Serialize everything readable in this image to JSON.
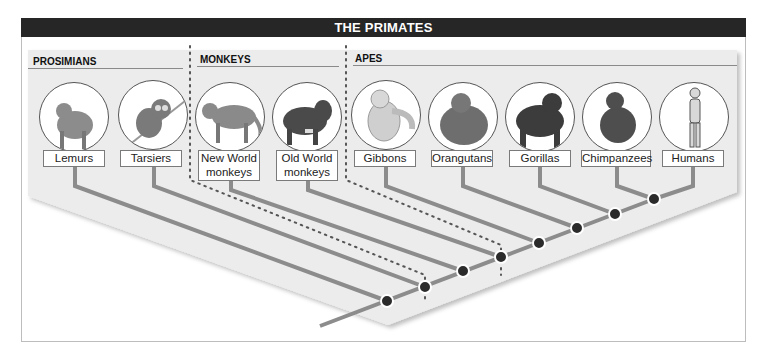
{
  "title": "THE PRIMATES",
  "sections": [
    {
      "label": "PROSIMIANS"
    },
    {
      "label": "MONKEYS"
    },
    {
      "label": "APES"
    }
  ],
  "taxa": [
    {
      "label": "Lemurs",
      "group": "PROSIMIANS",
      "icon": "lemur-icon",
      "fill": "#8c8c8c"
    },
    {
      "label": "Tarsiers",
      "group": "PROSIMIANS",
      "icon": "tarsier-icon",
      "fill": "#7a7a7a"
    },
    {
      "label": "New World monkeys",
      "line1": "New World",
      "line2": "monkeys",
      "group": "MONKEYS",
      "icon": "new-world-monkey-icon",
      "fill": "#8a8a8a"
    },
    {
      "label": "Old World monkeys",
      "line1": "Old World",
      "line2": "monkeys",
      "group": "MONKEYS",
      "icon": "old-world-monkey-icon",
      "fill": "#4a4a4a"
    },
    {
      "label": "Gibbons",
      "group": "APES",
      "icon": "gibbon-icon",
      "fill": "#cfcfcf"
    },
    {
      "label": "Orangutans",
      "group": "APES",
      "icon": "orangutan-icon",
      "fill": "#6e6e6e"
    },
    {
      "label": "Gorillas",
      "group": "APES",
      "icon": "gorilla-icon",
      "fill": "#3c3c3c"
    },
    {
      "label": "Chimpanzees",
      "group": "APES",
      "icon": "chimpanzee-icon",
      "fill": "#4e4e4e"
    },
    {
      "label": "Humans",
      "group": "APES",
      "icon": "human-icon",
      "fill": "#d8d8d8"
    }
  ],
  "colors": {
    "title_bar": "#262626",
    "panel": "#ececec",
    "branch": "#8c8c8c",
    "node": "#2b2b2b",
    "dotted_divider": "#555555"
  },
  "tree": {
    "node_count": 8
  }
}
